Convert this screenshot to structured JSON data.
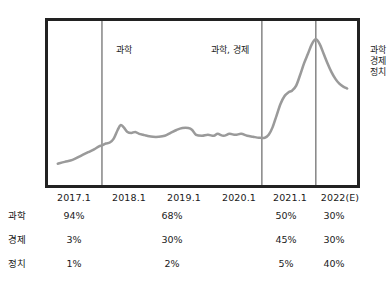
{
  "chart_data": {
    "type": "line",
    "title": "",
    "xlabel": "",
    "ylabel": "",
    "grid": false,
    "legend_position": "none",
    "line_color": "#9a9a9a",
    "frame_color": "#222222",
    "divider_color": "#8a8a8a",
    "x_ticks": [
      "2017.1",
      "2018.1",
      "2019.1",
      "2020.1",
      "2021.1",
      "2022(E)"
    ],
    "segment_annotations": [
      {
        "label": "과학",
        "lines": [
          "과학"
        ]
      },
      {
        "label": "과학, 경제",
        "lines": [
          "과학, 경제"
        ]
      },
      {
        "label": "과학 경제 정치",
        "lines": [
          "과학",
          "경제",
          "정치"
        ]
      }
    ],
    "divider_x_values": [
      "2017.7",
      "2020.7",
      "2021.8"
    ],
    "series": [
      {
        "name": "관심도",
        "points": [
          [
            55,
            166
          ],
          [
            62,
            164
          ],
          [
            70,
            162
          ],
          [
            78,
            158
          ],
          [
            86,
            154
          ],
          [
            92,
            151
          ],
          [
            97,
            148
          ],
          [
            100,
            147
          ],
          [
            104,
            145
          ],
          [
            108,
            144
          ],
          [
            112,
            140
          ],
          [
            116,
            131
          ],
          [
            119,
            126
          ],
          [
            122,
            128
          ],
          [
            126,
            133
          ],
          [
            130,
            134
          ],
          [
            134,
            133
          ],
          [
            138,
            135
          ],
          [
            142,
            136
          ],
          [
            146,
            137
          ],
          [
            152,
            138
          ],
          [
            158,
            138
          ],
          [
            164,
            137
          ],
          [
            170,
            134
          ],
          [
            176,
            131
          ],
          [
            182,
            129
          ],
          [
            188,
            129
          ],
          [
            192,
            131
          ],
          [
            196,
            136
          ],
          [
            202,
            137
          ],
          [
            208,
            136
          ],
          [
            214,
            137
          ],
          [
            218,
            135
          ],
          [
            224,
            137
          ],
          [
            230,
            135
          ],
          [
            236,
            136
          ],
          [
            242,
            135
          ],
          [
            248,
            137
          ],
          [
            254,
            138
          ],
          [
            260,
            139
          ],
          [
            266,
            139
          ],
          [
            270,
            136
          ],
          [
            274,
            128
          ],
          [
            278,
            116
          ],
          [
            282,
            104
          ],
          [
            286,
            96
          ],
          [
            290,
            92
          ],
          [
            294,
            90
          ],
          [
            298,
            85
          ],
          [
            302,
            74
          ],
          [
            306,
            62
          ],
          [
            310,
            52
          ],
          [
            314,
            42
          ],
          [
            318,
            37
          ],
          [
            322,
            42
          ],
          [
            326,
            52
          ],
          [
            330,
            62
          ],
          [
            334,
            71
          ],
          [
            338,
            78
          ],
          [
            342,
            83
          ],
          [
            346,
            86
          ],
          [
            350,
            88
          ]
        ]
      }
    ]
  },
  "table": {
    "rows": [
      {
        "label": "과학",
        "values": [
          "94%",
          "68%",
          "50%",
          "30%"
        ]
      },
      {
        "label": "경제",
        "values": [
          "3%",
          "30%",
          "45%",
          "30%"
        ]
      },
      {
        "label": "정치",
        "values": [
          "1%",
          "2%",
          "5%",
          "40%"
        ]
      }
    ]
  }
}
